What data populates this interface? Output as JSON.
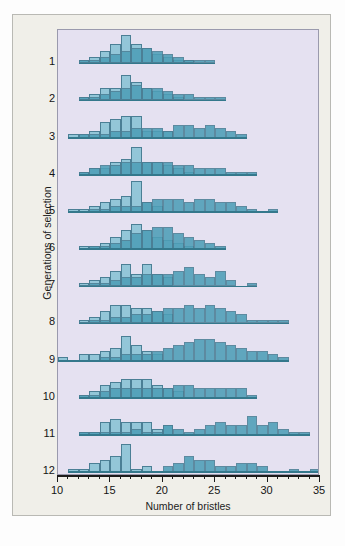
{
  "figure": {
    "x_axis_title": "Number of bristles",
    "y_axis_title": "Generations of selection"
  },
  "chart_data": {
    "type": "bar",
    "title": "",
    "xlabel": "Number of bristles",
    "ylabel": "Generations of selection",
    "xlim": [
      10,
      35
    ],
    "x_major_ticks": [
      10,
      15,
      20,
      25,
      30,
      35
    ],
    "x_minor_tick_step": 1,
    "grid": false,
    "legend_position": "none",
    "row_labels": [
      "1",
      "2",
      "3",
      "4",
      "5",
      "6",
      "7",
      "8",
      "9",
      "10",
      "11",
      "12"
    ],
    "series_names": [
      "Low-selected line",
      "High-selected line"
    ],
    "series_colors": [
      "#93c6d8",
      "#4e9fb8"
    ],
    "panel_background": "#e5e1f1",
    "card_background": "#f0efe9",
    "bar_edge_color": "#4b7f95",
    "note": "Each generation row contains two overlapping frequency histograms of bristle number; bin width is 1 bristle, value = relative frequency (arbitrary height units).",
    "rows": [
      {
        "generation": "1",
        "low": [
          [
            12,
            1
          ],
          [
            13,
            2
          ],
          [
            14,
            4
          ],
          [
            15,
            6
          ],
          [
            16,
            9
          ],
          [
            17,
            6
          ],
          [
            18,
            5
          ],
          [
            19,
            3
          ],
          [
            20,
            2
          ],
          [
            21,
            1
          ],
          [
            22,
            1
          ]
        ],
        "high": [
          [
            12,
            1
          ],
          [
            13,
            1
          ],
          [
            14,
            2
          ],
          [
            15,
            3
          ],
          [
            16,
            4
          ],
          [
            17,
            5
          ],
          [
            18,
            5
          ],
          [
            19,
            4
          ],
          [
            20,
            3
          ],
          [
            21,
            2
          ],
          [
            22,
            1
          ],
          [
            23,
            1
          ],
          [
            24,
            1
          ]
        ]
      },
      {
        "generation": "2",
        "low": [
          [
            12,
            1
          ],
          [
            13,
            2
          ],
          [
            14,
            4
          ],
          [
            15,
            4
          ],
          [
            16,
            8
          ],
          [
            17,
            6
          ],
          [
            18,
            4
          ],
          [
            19,
            3
          ],
          [
            20,
            2
          ],
          [
            21,
            1
          ]
        ],
        "high": [
          [
            12,
            1
          ],
          [
            13,
            1
          ],
          [
            14,
            2
          ],
          [
            15,
            3
          ],
          [
            16,
            4
          ],
          [
            17,
            5
          ],
          [
            18,
            4
          ],
          [
            19,
            4
          ],
          [
            20,
            3
          ],
          [
            21,
            2
          ],
          [
            22,
            2
          ],
          [
            23,
            1
          ],
          [
            24,
            1
          ],
          [
            25,
            1
          ]
        ]
      },
      {
        "generation": "3",
        "low": [
          [
            11,
            1
          ],
          [
            12,
            1
          ],
          [
            13,
            2
          ],
          [
            14,
            5
          ],
          [
            15,
            6
          ],
          [
            16,
            7
          ],
          [
            17,
            7
          ],
          [
            18,
            2
          ],
          [
            19,
            2
          ],
          [
            20,
            2
          ]
        ],
        "high": [
          [
            12,
            1
          ],
          [
            13,
            1
          ],
          [
            14,
            1
          ],
          [
            15,
            2
          ],
          [
            16,
            2
          ],
          [
            17,
            3
          ],
          [
            18,
            3
          ],
          [
            19,
            3
          ],
          [
            20,
            2
          ],
          [
            21,
            4
          ],
          [
            22,
            4
          ],
          [
            23,
            3
          ],
          [
            24,
            4
          ],
          [
            25,
            3
          ],
          [
            26,
            2
          ],
          [
            27,
            1
          ]
        ]
      },
      {
        "generation": "4",
        "low": [
          [
            12,
            1
          ],
          [
            13,
            2
          ],
          [
            14,
            2
          ],
          [
            15,
            4
          ],
          [
            16,
            5
          ],
          [
            17,
            9
          ],
          [
            18,
            4
          ],
          [
            19,
            4
          ],
          [
            20,
            3
          ],
          [
            21,
            2
          ],
          [
            22,
            1
          ]
        ],
        "high": [
          [
            12,
            1
          ],
          [
            13,
            2
          ],
          [
            14,
            3
          ],
          [
            15,
            3
          ],
          [
            16,
            4
          ],
          [
            17,
            4
          ],
          [
            18,
            4
          ],
          [
            19,
            4
          ],
          [
            20,
            4
          ],
          [
            21,
            3
          ],
          [
            22,
            3
          ],
          [
            23,
            2
          ],
          [
            24,
            2
          ],
          [
            25,
            2
          ],
          [
            26,
            1
          ],
          [
            27,
            1
          ],
          [
            28,
            1
          ]
        ]
      },
      {
        "generation": "5",
        "low": [
          [
            11,
            1
          ],
          [
            12,
            1
          ],
          [
            13,
            2
          ],
          [
            14,
            3
          ],
          [
            15,
            4
          ],
          [
            16,
            5
          ],
          [
            17,
            10
          ],
          [
            18,
            3
          ],
          [
            19,
            2
          ]
        ],
        "high": [
          [
            13,
            1
          ],
          [
            14,
            1
          ],
          [
            15,
            2
          ],
          [
            16,
            2
          ],
          [
            17,
            2
          ],
          [
            18,
            3
          ],
          [
            19,
            4
          ],
          [
            20,
            4
          ],
          [
            21,
            4
          ],
          [
            22,
            3
          ],
          [
            23,
            4
          ],
          [
            24,
            4
          ],
          [
            25,
            3
          ],
          [
            26,
            3
          ],
          [
            27,
            2
          ],
          [
            28,
            1
          ],
          [
            30,
            1
          ]
        ]
      },
      {
        "generation": "6",
        "low": [
          [
            12,
            1
          ],
          [
            13,
            1
          ],
          [
            14,
            2
          ],
          [
            15,
            4
          ],
          [
            16,
            6
          ],
          [
            17,
            8
          ],
          [
            18,
            6
          ],
          [
            19,
            4
          ],
          [
            20,
            3
          ],
          [
            21,
            2
          ],
          [
            22,
            1
          ]
        ],
        "high": [
          [
            13,
            1
          ],
          [
            14,
            1
          ],
          [
            15,
            2
          ],
          [
            16,
            3
          ],
          [
            17,
            5
          ],
          [
            18,
            6
          ],
          [
            19,
            7
          ],
          [
            20,
            7
          ],
          [
            21,
            5
          ],
          [
            22,
            4
          ],
          [
            23,
            3
          ],
          [
            24,
            2
          ],
          [
            25,
            1
          ]
        ]
      },
      {
        "generation": "7",
        "low": [
          [
            12,
            1
          ],
          [
            13,
            2
          ],
          [
            14,
            3
          ],
          [
            15,
            5
          ],
          [
            16,
            7
          ],
          [
            17,
            4
          ],
          [
            18,
            7
          ],
          [
            19,
            4
          ],
          [
            20,
            3
          ]
        ],
        "high": [
          [
            13,
            1
          ],
          [
            14,
            1
          ],
          [
            15,
            2
          ],
          [
            16,
            3
          ],
          [
            17,
            3
          ],
          [
            18,
            4
          ],
          [
            19,
            4
          ],
          [
            20,
            4
          ],
          [
            21,
            5
          ],
          [
            22,
            6
          ],
          [
            23,
            4
          ],
          [
            24,
            3
          ],
          [
            25,
            5
          ],
          [
            26,
            2
          ],
          [
            28,
            1
          ]
        ]
      },
      {
        "generation": "8",
        "low": [
          [
            12,
            1
          ],
          [
            13,
            2
          ],
          [
            14,
            4
          ],
          [
            15,
            6
          ],
          [
            16,
            6
          ],
          [
            17,
            5
          ],
          [
            18,
            5
          ],
          [
            19,
            4
          ],
          [
            20,
            3
          ]
        ],
        "high": [
          [
            13,
            1
          ],
          [
            14,
            1
          ],
          [
            15,
            2
          ],
          [
            16,
            2
          ],
          [
            17,
            3
          ],
          [
            18,
            3
          ],
          [
            19,
            4
          ],
          [
            20,
            5
          ],
          [
            21,
            5
          ],
          [
            22,
            6
          ],
          [
            23,
            5
          ],
          [
            24,
            6
          ],
          [
            25,
            5
          ],
          [
            26,
            4
          ],
          [
            27,
            3
          ],
          [
            28,
            1
          ],
          [
            29,
            1
          ],
          [
            30,
            1
          ],
          [
            31,
            1
          ]
        ]
      },
      {
        "generation": "9",
        "low": [
          [
            10,
            1
          ],
          [
            12,
            2
          ],
          [
            13,
            2
          ],
          [
            14,
            3
          ],
          [
            15,
            4
          ],
          [
            16,
            8
          ],
          [
            17,
            5
          ],
          [
            18,
            3
          ],
          [
            19,
            2
          ]
        ],
        "high": [
          [
            14,
            1
          ],
          [
            15,
            1
          ],
          [
            16,
            2
          ],
          [
            17,
            2
          ],
          [
            18,
            2
          ],
          [
            19,
            3
          ],
          [
            20,
            4
          ],
          [
            21,
            5
          ],
          [
            22,
            6
          ],
          [
            23,
            7
          ],
          [
            24,
            7
          ],
          [
            25,
            6
          ],
          [
            26,
            5
          ],
          [
            27,
            4
          ],
          [
            28,
            3
          ],
          [
            29,
            3
          ],
          [
            30,
            2
          ],
          [
            31,
            1
          ]
        ]
      },
      {
        "generation": "10",
        "low": [
          [
            12,
            1
          ],
          [
            13,
            2
          ],
          [
            14,
            4
          ],
          [
            15,
            5
          ],
          [
            16,
            6
          ],
          [
            17,
            6
          ],
          [
            18,
            6
          ],
          [
            19,
            4
          ],
          [
            20,
            3
          ],
          [
            21,
            2
          ]
        ],
        "high": [
          [
            12,
            1
          ],
          [
            13,
            1
          ],
          [
            14,
            2
          ],
          [
            15,
            3
          ],
          [
            16,
            3
          ],
          [
            17,
            3
          ],
          [
            18,
            3
          ],
          [
            19,
            3
          ],
          [
            20,
            3
          ],
          [
            21,
            4
          ],
          [
            22,
            4
          ],
          [
            23,
            3
          ],
          [
            24,
            3
          ],
          [
            25,
            3
          ],
          [
            26,
            3
          ],
          [
            27,
            3
          ],
          [
            28,
            1
          ]
        ]
      },
      {
        "generation": "11",
        "low": [
          [
            12,
            1
          ],
          [
            13,
            1
          ],
          [
            14,
            4
          ],
          [
            15,
            5
          ],
          [
            16,
            4
          ],
          [
            17,
            4
          ],
          [
            18,
            4
          ],
          [
            19,
            2
          ],
          [
            20,
            3
          ]
        ],
        "high": [
          [
            12,
            1
          ],
          [
            13,
            1
          ],
          [
            14,
            1
          ],
          [
            15,
            1
          ],
          [
            16,
            1
          ],
          [
            17,
            2
          ],
          [
            18,
            1
          ],
          [
            19,
            1
          ],
          [
            20,
            3
          ],
          [
            21,
            2
          ],
          [
            22,
            1
          ],
          [
            23,
            2
          ],
          [
            24,
            3
          ],
          [
            25,
            4
          ],
          [
            26,
            3
          ],
          [
            27,
            3
          ],
          [
            28,
            6
          ],
          [
            29,
            3
          ],
          [
            30,
            4
          ],
          [
            31,
            2
          ],
          [
            32,
            1
          ],
          [
            33,
            1
          ]
        ]
      },
      {
        "generation": "12",
        "low": [
          [
            11,
            1
          ],
          [
            12,
            1
          ],
          [
            13,
            3
          ],
          [
            14,
            4
          ],
          [
            15,
            5
          ],
          [
            16,
            9
          ],
          [
            17,
            1
          ],
          [
            18,
            2
          ]
        ],
        "high": [
          [
            20,
            2
          ],
          [
            21,
            3
          ],
          [
            22,
            5
          ],
          [
            23,
            4
          ],
          [
            24,
            4
          ],
          [
            25,
            2
          ],
          [
            26,
            2
          ],
          [
            27,
            3
          ],
          [
            28,
            3
          ],
          [
            29,
            2
          ],
          [
            32,
            1
          ],
          [
            34,
            1
          ]
        ]
      }
    ]
  }
}
